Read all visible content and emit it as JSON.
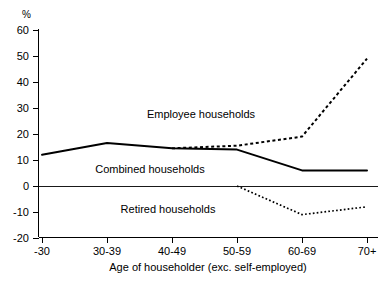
{
  "chart_data": {
    "type": "line",
    "title": "",
    "xlabel": "Age of householder (exc. self-employed)",
    "ylabel": "%",
    "categories": [
      "-30",
      "30-39",
      "40-49",
      "50-59",
      "60-69",
      "70+"
    ],
    "ylim": [
      -20,
      60
    ],
    "ytick_labels": [
      "60",
      "50",
      "40",
      "30",
      "20",
      "10",
      "0",
      "-10",
      "-20"
    ],
    "ytick_values": [
      60,
      50,
      40,
      30,
      20,
      10,
      0,
      -10,
      -20
    ],
    "grid": false,
    "legend_position": "inline-annotations",
    "zero_line": true,
    "series": [
      {
        "name": "Combined households",
        "style": "solid",
        "x": [
          "-30",
          "30-39",
          "40-49",
          "50-59",
          "60-69",
          "70+"
        ],
        "values": [
          12,
          16.5,
          14.5,
          14,
          6,
          6
        ]
      },
      {
        "name": "Employee households",
        "style": "dashed",
        "x": [
          "40-49",
          "50-59",
          "60-69",
          "70+"
        ],
        "values": [
          14.5,
          15.5,
          19,
          49
        ]
      },
      {
        "name": "Retired households",
        "style": "dotted",
        "x": [
          "50-59",
          "60-69",
          "70+"
        ],
        "values": [
          0,
          -11,
          -8
        ]
      }
    ],
    "annotations": [
      {
        "text": "Employee households",
        "x_px": 201,
        "y_px": 118
      },
      {
        "text": "Combined households",
        "x_px": 150,
        "y_px": 173
      },
      {
        "text": "Retired households",
        "x_px": 168,
        "y_px": 213
      }
    ]
  }
}
